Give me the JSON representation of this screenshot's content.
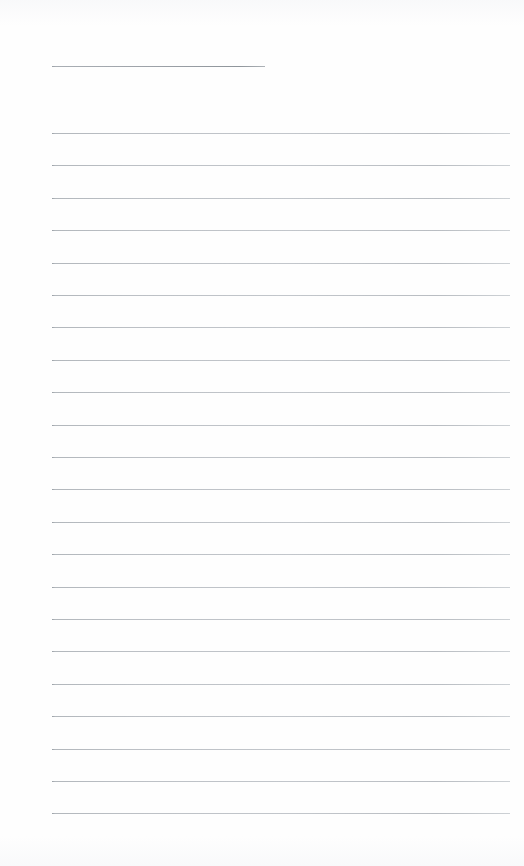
{
  "page": {
    "kind": "lined-notepad-page",
    "width_px": 524,
    "height_px": 866,
    "background_color": "#fefefe",
    "rule_color": "#b9bdc2",
    "content_text": "",
    "annotation": "blank ruled writing sheet — no text, headings, or marks present"
  },
  "header_rule": {
    "label": "title-rule",
    "x_start_px": 52,
    "x_end_px": 265,
    "y_px": 66,
    "thickness_px": 1
  },
  "body_rules": {
    "label": "writing-rules",
    "count": 22,
    "x_start_px": 52,
    "x_end_px": 510,
    "first_y_px": 133,
    "spacing_px": 32.4,
    "thickness_px": 1,
    "y_positions": [
      133,
      165.4,
      197.8,
      230.2,
      262.6,
      295,
      327.4,
      359.8,
      392.2,
      424.6,
      457,
      489.4,
      521.8,
      554.2,
      586.6,
      619,
      651.4,
      683.8,
      716.2,
      748.6,
      781,
      813.4
    ]
  }
}
